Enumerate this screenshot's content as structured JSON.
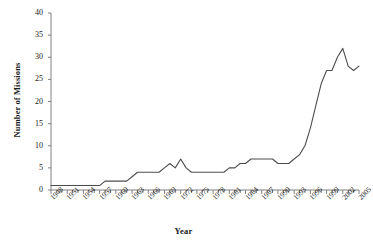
{
  "chart_data": {
    "type": "line",
    "title": "",
    "xlabel": "Year",
    "ylabel": "Number of Missions",
    "xlim": [
      1948,
      2005
    ],
    "ylim": [
      0,
      40
    ],
    "ytick_step": 5,
    "xtick_step": 3,
    "grid": false,
    "legend": "none",
    "yticks": [
      "0",
      "5",
      "10",
      "15",
      "20",
      "25",
      "30",
      "35",
      "40"
    ],
    "xticks": [
      "1948",
      "1951",
      "1954",
      "1957",
      "1960",
      "1963",
      "1966",
      "1969",
      "1972",
      "1975",
      "1978",
      "1981",
      "1984",
      "1987",
      "1990",
      "1993",
      "1996",
      "1999",
      "2002",
      "2005"
    ],
    "line_color": "#4d4d4d",
    "axis_color": "#808080",
    "x": [
      1948,
      1949,
      1950,
      1951,
      1952,
      1953,
      1954,
      1955,
      1956,
      1957,
      1958,
      1959,
      1960,
      1961,
      1962,
      1963,
      1964,
      1965,
      1966,
      1967,
      1968,
      1969,
      1970,
      1971,
      1972,
      1973,
      1974,
      1975,
      1976,
      1977,
      1978,
      1979,
      1980,
      1981,
      1982,
      1983,
      1984,
      1985,
      1986,
      1987,
      1988,
      1989,
      1990,
      1991,
      1992,
      1993,
      1994,
      1995,
      1996,
      1997,
      1998,
      1999,
      2000,
      2001,
      2002,
      2003,
      2004,
      2005
    ],
    "values": [
      1,
      1,
      1,
      1,
      1,
      1,
      1,
      1,
      1,
      1,
      2,
      2,
      2,
      2,
      2,
      3,
      4,
      4,
      4,
      4,
      4,
      5,
      6,
      5,
      7,
      5,
      4,
      4,
      4,
      4,
      4,
      4,
      4,
      5,
      5,
      6,
      6,
      7,
      7,
      7,
      7,
      7,
      6,
      6,
      6,
      7,
      8,
      10,
      14,
      19,
      24,
      27,
      27,
      30,
      32,
      28,
      27,
      28
    ]
  },
  "chart_series_points": {
    "note": "",
    "series_name": "Missions"
  }
}
